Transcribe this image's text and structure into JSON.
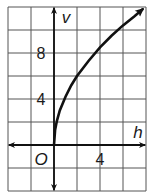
{
  "chart_data": {
    "type": "line",
    "title": "",
    "xlabel": "h",
    "ylabel": "v",
    "origin_label": "O",
    "x_tick_labels": [
      {
        "value": 4,
        "label": "4"
      }
    ],
    "y_tick_labels": [
      {
        "value": 4,
        "label": "4"
      },
      {
        "value": 8,
        "label": "8"
      }
    ],
    "grid": true,
    "grid_step": 2,
    "xlim": [
      -4,
      8
    ],
    "ylim": [
      -4,
      12
    ],
    "series": [
      {
        "name": "v(h)",
        "x": [
          0,
          0.1,
          0.25,
          0.5,
          1,
          1.5,
          2,
          3,
          4,
          5,
          6,
          7,
          7.7
        ],
        "values": [
          0,
          1.3,
          2.1,
          3.0,
          4.2,
          5.2,
          6.0,
          7.3,
          8.5,
          9.5,
          10.4,
          11.2,
          11.8
        ],
        "arrow_end": true
      }
    ],
    "axes_arrows": true
  },
  "colors": {
    "grid": "#555555",
    "axis": "#111111",
    "curve": "#111111",
    "background": "#ffffff"
  }
}
